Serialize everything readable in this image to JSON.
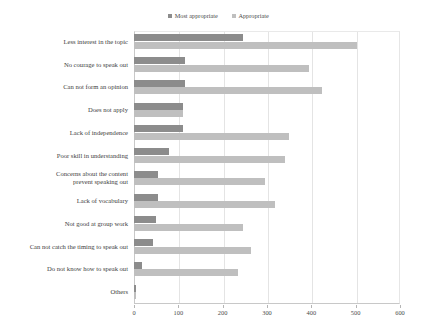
{
  "chart_data": {
    "type": "bar",
    "orientation": "horizontal",
    "title": "",
    "subtitle": "",
    "xlabel": "",
    "ylabel": "",
    "xlim": [
      0,
      600
    ],
    "xticks": [
      0,
      100,
      200,
      300,
      400,
      500,
      600
    ],
    "grid": true,
    "legend_position": "top-center",
    "categories": [
      "Less interest in the topic",
      "No courage to speak out",
      "Can not form an opinion",
      "Does not apply",
      "Lack of independence",
      "Poor skill  in understanding",
      "Concerns about the content\nprevent speaking out",
      "Lack of vocabulary",
      "Not good at group work",
      "Can not catch the timing to speak out",
      "Do not know how to speak out",
      "Others"
    ],
    "series": [
      {
        "name": "Most appropriate",
        "color": "#8c8c8c",
        "values": [
          245,
          115,
          115,
          110,
          110,
          78,
          55,
          55,
          50,
          42,
          18,
          5
        ]
      },
      {
        "name": "Appropriate",
        "color": "#bfbfbf",
        "values": [
          503,
          395,
          425,
          110,
          350,
          340,
          295,
          318,
          245,
          265,
          235,
          4
        ]
      }
    ]
  },
  "legend": {
    "entries": [
      {
        "label": "Most appropriate",
        "color": "#8c8c8c"
      },
      {
        "label": "Appropriate",
        "color": "#bfbfbf"
      }
    ]
  },
  "axis": {
    "tick_labels": [
      "0",
      "100",
      "200",
      "300",
      "400",
      "500",
      "600"
    ]
  }
}
